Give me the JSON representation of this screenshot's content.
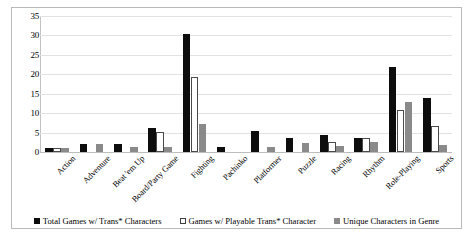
{
  "chart_data": {
    "type": "bar",
    "title": "",
    "subtitle": "",
    "xlabel": "",
    "ylabel": "",
    "ylim": [
      0,
      35
    ],
    "ytick_step": 5,
    "yticks": [
      "0",
      "5",
      "10",
      "15",
      "20",
      "25",
      "30",
      "35"
    ],
    "grid": true,
    "legend_position": "bottom",
    "categories": [
      "Action",
      "Adventure",
      "Beat 'em Up",
      "Board/Party Game",
      "Fighting",
      "Pachinko",
      "Platformer",
      "Puzzle",
      "Racing",
      "Rhythm",
      "Role-Playing",
      "Sports"
    ],
    "series": [
      {
        "name": "Total Games w/ Trans* Characters",
        "color": "#0d0d0d",
        "values": [
          1,
          2,
          2,
          6.3,
          30.3,
          1.4,
          5.3,
          3.5,
          4.5,
          3.6,
          21.8,
          13.9
        ]
      },
      {
        "name": "Games w/ Playable Trans* Character",
        "color": "#ffffff",
        "values": [
          1,
          0,
          0,
          5.2,
          19.4,
          0,
          0,
          0,
          2.5,
          3.5,
          10.8,
          6.8
        ]
      },
      {
        "name": "Unique Characters in Genre",
        "color": "#8a8a8a",
        "values": [
          1,
          2.1,
          1.2,
          1.4,
          7.3,
          0,
          1.4,
          2.2,
          1.5,
          2.6,
          12.8,
          1.7
        ]
      }
    ]
  },
  "legend": {
    "items": [
      {
        "label": "Total Games w/ Trans* Characters"
      },
      {
        "label": "Games w/ Playable Trans* Character"
      },
      {
        "label": "Unique Characters in Genre"
      }
    ]
  }
}
